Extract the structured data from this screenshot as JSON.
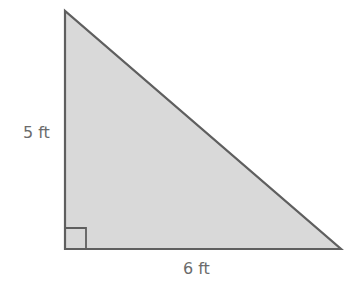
{
  "diagram": {
    "type": "right-triangle",
    "fill_color": "#d9d9d9",
    "stroke_color": "#5f5f5f",
    "vertices": {
      "top": [
        65,
        11
      ],
      "right_angle": [
        65,
        249
      ],
      "right": [
        341,
        249
      ]
    },
    "right_angle_marker": {
      "x": 65,
      "y": 228,
      "size": 21
    },
    "labels": {
      "height": "5 ft",
      "base": "6 ft"
    }
  }
}
